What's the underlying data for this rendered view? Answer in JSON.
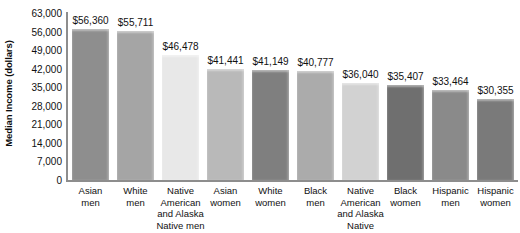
{
  "chart_data": {
    "type": "bar",
    "title": "",
    "xlabel": "",
    "ylabel": "Median Income (dollars)",
    "ylim": [
      0,
      63000
    ],
    "ytick_step": 7000,
    "yticks": [
      "63,000",
      "56,000",
      "49,000",
      "42,000",
      "35,000",
      "28,000",
      "21,000",
      "14,000",
      "7,000",
      "0"
    ],
    "ytick_values": [
      63000,
      56000,
      49000,
      42000,
      35000,
      28000,
      21000,
      14000,
      7000,
      0
    ],
    "grid": false,
    "legend": "none",
    "categories": [
      "Asian men",
      "White men",
      "Native American and Alaska Native men",
      "Asian women",
      "White women",
      "Black men",
      "Native American and Alaska Native women",
      "Black women",
      "Hispanic men",
      "Hispanic women"
    ],
    "category_lines": [
      [
        "Asian",
        "men"
      ],
      [
        "White",
        "men"
      ],
      [
        "Native",
        "American",
        "and Alaska",
        "Native men"
      ],
      [
        "Asian",
        "women"
      ],
      [
        "White",
        "women"
      ],
      [
        "Black",
        "men"
      ],
      [
        "Native",
        "American",
        "and Alaska",
        "Native women"
      ],
      [
        "Black",
        "women"
      ],
      [
        "Hispanic",
        "men"
      ],
      [
        "Hispanic",
        "women"
      ]
    ],
    "values": [
      56360,
      55711,
      46478,
      41441,
      41149,
      40777,
      36040,
      35407,
      33464,
      30355
    ],
    "value_labels": [
      "$56,360",
      "$55,711",
      "$46,478",
      "$41,441",
      "$41,149",
      "$40,777",
      "$36,040",
      "$35,407",
      "$33,464",
      "$30,355"
    ],
    "bar_colors": [
      "#8e8e8e",
      "#a5a5a5",
      "#e8e8e8",
      "#b9b9b9",
      "#7f7f7f",
      "#ababab",
      "#d2d2d2",
      "#6f6f6f",
      "#8a8a8a",
      "#7a7a7a"
    ],
    "axis_color": "#8d8d8d",
    "text_color": "#111111",
    "background": "#ffffff"
  }
}
